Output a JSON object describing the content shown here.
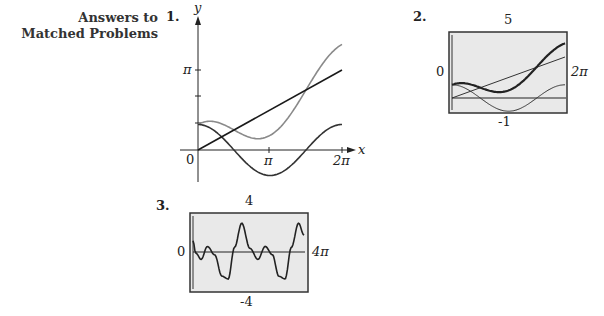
{
  "section": {
    "heading_line1": "Answers to",
    "heading_line2": "Matched Problems"
  },
  "problems": [
    {
      "number": "1."
    },
    {
      "number": "2."
    },
    {
      "number": "3."
    }
  ],
  "chart_data": [
    {
      "type": "line",
      "title": "",
      "xlabel": "x",
      "ylabel": "y",
      "x_ticks": [
        "0",
        "π",
        "2π"
      ],
      "y_ticks": [
        "π"
      ],
      "xlim": [
        0,
        6.283
      ],
      "ylim": [
        -1.1,
        4.3
      ],
      "grid": false,
      "series": [
        {
          "name": "y = x/2",
          "color": "#1a1a1a",
          "x": [
            0,
            6.283
          ],
          "y": [
            0,
            3.1416
          ]
        },
        {
          "name": "y = cos x",
          "color": "#333333",
          "x": [
            0,
            0.785,
            1.571,
            2.356,
            3.142,
            3.927,
            4.712,
            5.498,
            6.283
          ],
          "y": [
            1,
            0.707,
            0,
            -0.707,
            -1,
            -0.707,
            0,
            0.707,
            1
          ]
        },
        {
          "name": "y = x/2 + cos x",
          "color": "#8a8a8a",
          "x": [
            0,
            0.785,
            1.571,
            2.356,
            3.142,
            3.927,
            4.712,
            5.498,
            6.283
          ],
          "y": [
            1,
            1.1,
            0.785,
            0.471,
            0.571,
            1.257,
            2.356,
            3.456,
            4.142
          ]
        }
      ]
    },
    {
      "type": "line",
      "title": "",
      "window": {
        "xmin": "0",
        "xmax": "2π",
        "ymin": "-1",
        "ymax": "5"
      },
      "labels": {
        "top": "5",
        "bottom": "-1",
        "left": "0",
        "right": "2π"
      },
      "xlim": [
        0,
        6.283
      ],
      "ylim": [
        -1,
        5
      ],
      "grid": false,
      "series": [
        {
          "name": "line",
          "x": [
            0,
            6.283
          ],
          "y": [
            0,
            3.1416
          ]
        },
        {
          "name": "cos",
          "x": [
            0,
            0.785,
            1.571,
            2.356,
            3.142,
            3.927,
            4.712,
            5.498,
            6.283
          ],
          "y": [
            1,
            0.707,
            0,
            -0.707,
            -1,
            -0.707,
            0,
            0.707,
            1
          ]
        },
        {
          "name": "sum (thick)",
          "x": [
            0,
            0.785,
            1.571,
            2.356,
            3.142,
            3.927,
            4.712,
            5.498,
            6.283
          ],
          "y": [
            1,
            1.1,
            0.785,
            0.471,
            0.571,
            1.257,
            2.356,
            3.456,
            4.142
          ]
        }
      ]
    },
    {
      "type": "line",
      "title": "",
      "window": {
        "xmin": "0",
        "xmax": "4π",
        "ymin": "-4",
        "ymax": "4"
      },
      "labels": {
        "top": "4",
        "bottom": "-4",
        "left": "0",
        "right": "4π"
      },
      "xlim": [
        0,
        12.566
      ],
      "ylim": [
        -4,
        4
      ],
      "grid": false,
      "series": [
        {
          "name": "curve",
          "x": [
            0,
            0.3,
            0.9,
            1.6,
            2.4,
            3.2,
            3.9,
            4.6,
            5.4,
            6.3,
            7.2,
            8.0,
            8.8,
            9.5,
            10.2,
            10.9,
            11.7,
            12.3
          ],
          "y": [
            1.2,
            -0.1,
            -0.8,
            0.6,
            -0.3,
            -2.6,
            -2.9,
            0.5,
            3.1,
            0.4,
            -0.8,
            0.6,
            -0.3,
            -2.6,
            -2.9,
            0.5,
            3.1,
            1.8
          ]
        }
      ]
    }
  ]
}
